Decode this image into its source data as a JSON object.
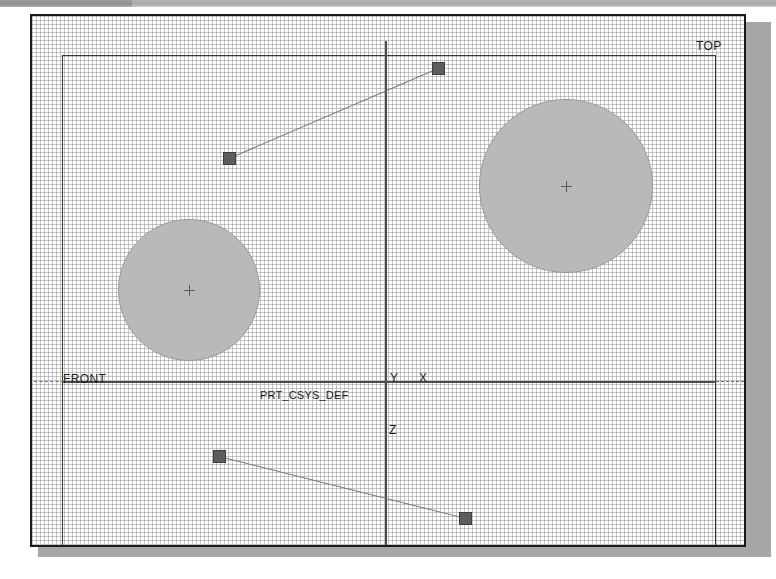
{
  "window": {
    "title_strip_visible": true,
    "background_color": "#ffffff",
    "frame_color": "#1a1a1a",
    "shadow_color": "#a6a6a6"
  },
  "viewport": {
    "grid": {
      "visible": true,
      "style": "dotted",
      "spacing_px": 37,
      "color": "#8e8e8e"
    },
    "part_boundary": {
      "visible": true,
      "color": "#3a3a3a"
    }
  },
  "labels": {
    "top_view": "TOP",
    "front_view": "FRONT",
    "csys_name": "PRT_CSYS_DEF",
    "axis_x": "X",
    "axis_y": "Y",
    "axis_z": "Z"
  },
  "features": {
    "circles": [
      {
        "name": "left-circular-feature",
        "center_x": 187,
        "center_y": 288,
        "radius": 71,
        "fill": "#b9b9b9",
        "has_center_mark": true
      },
      {
        "name": "right-circular-feature",
        "center_x": 566,
        "center_y": 184,
        "radius": 87,
        "fill": "#b9b9b9",
        "has_center_mark": true
      }
    ],
    "point_markers": [
      {
        "name": "marker-upper-left",
        "x": 229,
        "y": 158,
        "fill": "#5d5d5d"
      },
      {
        "name": "marker-upper-right",
        "x": 438,
        "y": 68,
        "fill": "#5d5d5d"
      },
      {
        "name": "marker-lower-left",
        "x": 219,
        "y": 456,
        "fill": "#5d5d5d"
      },
      {
        "name": "marker-lower-right",
        "x": 465,
        "y": 518,
        "fill": "#5d5d5d"
      }
    ],
    "connector_lines": [
      {
        "name": "connector-upper",
        "x1": 229,
        "y1": 158,
        "x2": 438,
        "y2": 68,
        "color": "#777777"
      },
      {
        "name": "connector-lower",
        "x1": 219,
        "y1": 456,
        "x2": 465,
        "y2": 518,
        "color": "#777777"
      }
    ]
  },
  "datums": {
    "horizontal_axis_y": 381,
    "vertical_axis_x": 383,
    "color": "#4c4c4c"
  }
}
